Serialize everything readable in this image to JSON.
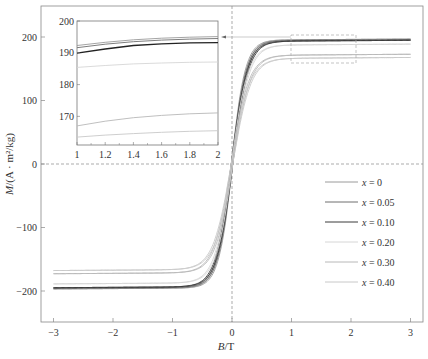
{
  "chart_data": [
    {
      "type": "line",
      "title": "",
      "xlabel": "B/T",
      "ylabel": "M/(A · m²/kg)",
      "xlim": [
        -3.2,
        3.2
      ],
      "ylim": [
        -250,
        245
      ],
      "xticks": [
        -3,
        -2,
        -1,
        0,
        1,
        2,
        3
      ],
      "yticks": [
        -200,
        -100,
        0,
        100,
        200
      ],
      "xtick_labels": [
        "−3",
        "−2",
        "−1",
        "0",
        "1",
        "2",
        "3"
      ],
      "ytick_labels": [
        "−200",
        "−100",
        "0",
        "100",
        "200"
      ],
      "grid": false,
      "reference_lines": {
        "x0_dashed": true,
        "y0_dashed": true
      },
      "legend_position": "lower right",
      "series": [
        {
          "name": "x = 0",
          "color": "#9a9a9a",
          "Ms": 195,
          "slope_scale": 0.34
        },
        {
          "name": "x = 0.05",
          "color": "#6e6e6e",
          "Ms": 194,
          "slope_scale": 0.36
        },
        {
          "name": "x = 0.10",
          "color": "#3a3a3a",
          "Ms": 193,
          "slope_scale": 0.38
        },
        {
          "name": "x = 0.20",
          "color": "#d6d6d6",
          "Ms": 187,
          "slope_scale": 0.4
        },
        {
          "name": "x = 0.30",
          "color": "#b8b8b8",
          "Ms": 171,
          "slope_scale": 0.42
        },
        {
          "name": "x = 0.40",
          "color": "#c8c8c8",
          "Ms": 166,
          "slope_scale": 0.44
        }
      ],
      "x": [
        -3,
        -2,
        -1,
        -0.5,
        -0.3,
        -0.2,
        -0.1,
        0,
        0.1,
        0.2,
        0.3,
        0.5,
        1,
        2,
        3
      ],
      "values_approx": {
        "x = 0": [
          -195,
          -194,
          -190,
          -176,
          -150,
          -115,
          -60,
          0,
          60,
          115,
          150,
          176,
          190,
          194,
          195
        ],
        "x = 0.05": [
          -194,
          -193,
          -189,
          -174,
          -147,
          -112,
          -58,
          0,
          58,
          112,
          147,
          174,
          189,
          193,
          194
        ],
        "x = 0.10": [
          -193,
          -192,
          -188,
          -172,
          -143,
          -108,
          -56,
          0,
          56,
          108,
          143,
          172,
          188,
          192,
          193
        ],
        "x = 0.20": [
          -187,
          -186,
          -184,
          -168,
          -140,
          -104,
          -54,
          0,
          54,
          104,
          140,
          168,
          184,
          186,
          187
        ],
        "x = 0.30": [
          -171,
          -170,
          -166,
          -154,
          -128,
          -96,
          -50,
          0,
          50,
          96,
          128,
          154,
          166,
          170,
          171
        ],
        "x = 0.40": [
          -166,
          -165,
          -163,
          -150,
          -124,
          -92,
          -48,
          0,
          48,
          92,
          124,
          150,
          163,
          165,
          166
        ]
      },
      "zoom_region": {
        "x": [
          1,
          2.1
        ],
        "y": [
          185,
          200
        ]
      }
    },
    {
      "type": "line",
      "title": "inset",
      "xlim": [
        1,
        2
      ],
      "ylim": [
        161,
        200
      ],
      "xticks": [
        1,
        1.2,
        1.4,
        1.6,
        1.8,
        2
      ],
      "yticks": [
        170,
        180,
        190,
        200
      ],
      "xtick_labels": [
        "1",
        "1.2",
        "1.4",
        "1.6",
        "1.8",
        "2"
      ],
      "ytick_labels": [
        "170",
        "180",
        "190",
        "200"
      ],
      "x": [
        1,
        1.2,
        1.4,
        1.6,
        1.8,
        2
      ],
      "series": [
        {
          "name": "x = 0",
          "values": [
            192.3,
            193.3,
            194.1,
            194.6,
            194.9,
            195.1
          ]
        },
        {
          "name": "x = 0.05",
          "values": [
            191.6,
            192.7,
            193.5,
            194.0,
            194.3,
            194.5
          ]
        },
        {
          "name": "x = 0.10",
          "values": [
            189.9,
            191.2,
            192.3,
            192.8,
            193.1,
            193.2
          ]
        },
        {
          "name": "x = 0.20",
          "values": [
            185.4,
            186.0,
            186.5,
            186.8,
            187.0,
            187.1
          ]
        },
        {
          "name": "x = 0.30",
          "values": [
            167.0,
            168.5,
            169.6,
            170.3,
            170.8,
            171.1
          ]
        },
        {
          "name": "x = 0.40",
          "values": [
            163.5,
            164.1,
            164.6,
            165.0,
            165.3,
            165.5
          ]
        }
      ]
    }
  ],
  "labels": {
    "xlabel_B": "B",
    "xlabel_unit": "/T",
    "ylabel_M": "M",
    "ylabel_unit": "/(A · m²/kg)"
  }
}
